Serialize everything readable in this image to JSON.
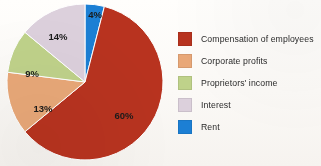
{
  "chart_data": {
    "type": "pie",
    "title": "",
    "subtitle": "",
    "xlabel": "",
    "ylabel": "",
    "grid": false,
    "legend_position": "right",
    "start_angle_deg": -90,
    "direction": "clockwise",
    "categories": [
      "Compensation of employees",
      "Corporate profits",
      "Proprietors' income",
      "Interest",
      "Rent"
    ],
    "values": [
      60,
      13,
      9,
      14,
      4
    ],
    "value_labels": [
      "60%",
      "13%",
      "9%",
      "14%",
      "4%"
    ],
    "colors": [
      "#b8331f",
      "#e9a878",
      "#bfd28a",
      "#dcd0dc",
      "#1c7fd4"
    ],
    "slices": [
      {
        "name": "Rent",
        "value": 4,
        "label": "4%",
        "color": "#1c7fd4",
        "start_deg": -90,
        "end_deg": -75.6,
        "label_x": 95,
        "label_y": 18
      },
      {
        "name": "Compensation of employees",
        "value": 60,
        "label": "60%",
        "color": "#b8331f",
        "start_deg": -75.6,
        "end_deg": 140.4,
        "label_x": 124,
        "label_y": 119
      },
      {
        "name": "Corporate profits",
        "value": 13,
        "label": "13%",
        "color": "#e9a878",
        "start_deg": 140.4,
        "end_deg": 187.2,
        "label_x": 43,
        "label_y": 112
      },
      {
        "name": "Proprietors' income",
        "value": 9,
        "label": "9%",
        "color": "#bfd28a",
        "start_deg": 187.2,
        "end_deg": 219.6,
        "label_x": 32,
        "label_y": 77
      },
      {
        "name": "Interest",
        "value": 14,
        "label": "14%",
        "color": "#dcd0dc",
        "start_deg": 219.6,
        "end_deg": 270,
        "label_x": 58,
        "label_y": 40
      }
    ]
  },
  "legend": {
    "items": [
      {
        "label": "Compensation of employees",
        "color": "#b8331f"
      },
      {
        "label": "Corporate profits",
        "color": "#e9a878"
      },
      {
        "label": "Proprietors' income",
        "color": "#bfd28a"
      },
      {
        "label": "Interest",
        "color": "#dcd0dc"
      },
      {
        "label": "Rent",
        "color": "#1c7fd4"
      }
    ]
  }
}
